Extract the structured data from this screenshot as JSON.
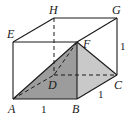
{
  "diagram": {
    "type": "cube-with-pyramid",
    "colors": {
      "edge": "#1a1a1a",
      "face_FAB": "#9c9c9c",
      "face_FBC": "#c9c9c9",
      "background": "#ffffff"
    },
    "vertices": {
      "A": {
        "label": "A",
        "x": 13,
        "y": 99
      },
      "B": {
        "label": "B",
        "x": 77,
        "y": 99
      },
      "C": {
        "label": "C",
        "x": 117,
        "y": 75
      },
      "D": {
        "label": "D",
        "x": 54,
        "y": 75
      },
      "E": {
        "label": "E",
        "x": 13,
        "y": 42
      },
      "F": {
        "label": "F",
        "x": 77,
        "y": 42
      },
      "G": {
        "label": "G",
        "x": 117,
        "y": 18
      },
      "H": {
        "label": "H",
        "x": 54,
        "y": 18
      }
    },
    "edge_labels": {
      "AB": "1",
      "BC": "1",
      "CG": "1"
    },
    "solid_edges": [
      "AB",
      "BC",
      "CG",
      "GF",
      "FE",
      "EA",
      "EH",
      "HG",
      "FB",
      "FA",
      "FC"
    ],
    "dashed_edges": [
      "AD",
      "DC",
      "HD",
      "FD"
    ],
    "shaded_faces": [
      "FAB",
      "FBC"
    ]
  }
}
